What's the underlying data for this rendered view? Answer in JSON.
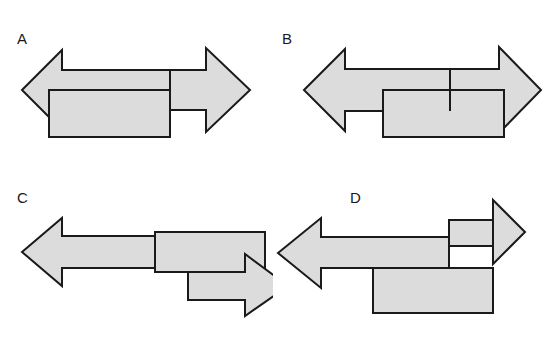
{
  "figure": {
    "background_color": "#ffffff",
    "shape_fill_color": "#dcdcdc",
    "shape_stroke_color": "#1a1a1a",
    "stroke_width": 2,
    "panel_count": 4
  },
  "panels": [
    {
      "id": "a",
      "label": "A",
      "description": "Double-headed horizontal arrow with an overlapping rectangle below-left",
      "shapes": [
        {
          "name": "double-arrow",
          "kind": "double-headed-arrow",
          "points": "22,90 62,50 62,70 206,70 206,48 250,90 206,132 206,110 62,110 62,130"
        },
        {
          "name": "rectangle",
          "kind": "rectangle",
          "x": 49,
          "y": 90,
          "width": 121,
          "height": 47
        }
      ],
      "dividers": [
        {
          "name": "arrow-rectangle-seam",
          "x1": 170,
          "y1": 70,
          "x2": 170,
          "y2": 110
        }
      ]
    },
    {
      "id": "b",
      "label": "B",
      "description": "Double-headed horizontal arrow with an overlapping rectangle below-center-right",
      "shapes": [
        {
          "name": "double-arrow",
          "kind": "double-headed-arrow",
          "points": "31,90 72,49 72,69 226,69 226,47 268,90 226,133 226,111 72,111 72,131"
        },
        {
          "name": "rectangle",
          "kind": "rectangle",
          "x": 110,
          "y": 90,
          "width": 121,
          "height": 47
        }
      ],
      "dividers": [
        {
          "name": "arrow-rectangle-seam",
          "x1": 177,
          "y1": 69,
          "x2": 177,
          "y2": 111
        }
      ]
    },
    {
      "id": "c",
      "label": "C",
      "description": "Left-pointing arrow, a rectangle overlapping its tail, and a smaller right-pointing arrow stepped below",
      "shapes": [
        {
          "name": "left-arrow",
          "kind": "single-headed-arrow-left",
          "points": "22,72 62,38 62,56 210,56 210,88 62,88 62,106"
        },
        {
          "name": "rectangle",
          "kind": "rectangle",
          "x": 155,
          "y": 52,
          "width": 110,
          "height": 40
        },
        {
          "name": "right-arrow",
          "kind": "single-headed-arrow-right",
          "points": "188,92 245,92 245,74 288,106 245,136 245,120 188,120"
        }
      ],
      "dividers": []
    },
    {
      "id": "d",
      "label": "D",
      "description": "Left-pointing arrow stacked over a rectangle, with a right-pointing arrow offset upward on the right",
      "shapes": [
        {
          "name": "right-arrow",
          "kind": "single-headed-arrow-right",
          "points": "176,40 220,40 220,20 252,52 220,84 220,66 176,66"
        },
        {
          "name": "left-arrow",
          "kind": "single-headed-arrow-left",
          "points": "5,73 48,38 48,57 176,57 176,88 48,88 48,108"
        },
        {
          "name": "rectangle",
          "kind": "rectangle",
          "x": 100,
          "y": 88,
          "width": 120,
          "height": 45
        }
      ],
      "dividers": [
        {
          "name": "arrow-right-seam",
          "x1": 220,
          "y1": 40,
          "x2": 220,
          "y2": 66
        }
      ]
    }
  ]
}
